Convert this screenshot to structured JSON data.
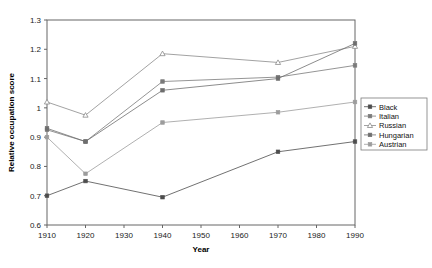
{
  "chart_data": {
    "type": "line",
    "title": "",
    "subtitle": "",
    "xlabel": "Year",
    "ylabel": "Relative occupation score",
    "x": [
      1910,
      1920,
      1940,
      1970,
      1990
    ],
    "xticklabels": [
      "1910",
      "1920",
      "1930",
      "1940",
      "1950",
      "1960",
      "1970",
      "1980",
      "1990"
    ],
    "xticks": [
      1910,
      1920,
      1930,
      1940,
      1950,
      1960,
      1970,
      1980,
      1990
    ],
    "yticklabels": [
      "0.6",
      "0.7",
      "0.8",
      "0.9",
      "1",
      "1.1",
      "1.2",
      "1.3"
    ],
    "yticks": [
      0.6,
      0.7,
      0.8,
      0.9,
      1.0,
      1.1,
      1.2,
      1.3
    ],
    "xlim": [
      1910,
      1990
    ],
    "ylim": [
      0.6,
      1.3
    ],
    "grid": false,
    "legend_position": "right",
    "series": [
      {
        "name": "Black",
        "marker": "filled-square",
        "color": "#4d4d4d",
        "values": [
          0.7,
          0.75,
          0.695,
          0.85,
          0.885
        ]
      },
      {
        "name": "Italian",
        "marker": "filled-square",
        "color": "#7a7a7a",
        "values": [
          0.925,
          0.885,
          1.09,
          1.105,
          1.145
        ]
      },
      {
        "name": "Russian",
        "marker": "open-triangle",
        "color": "#8a8a8a",
        "values": [
          1.02,
          0.975,
          1.185,
          1.155,
          1.21
        ]
      },
      {
        "name": "Hungarian",
        "marker": "filled-square",
        "color": "#6e6e6e",
        "values": [
          0.93,
          0.885,
          1.06,
          1.1,
          1.22
        ]
      },
      {
        "name": "Austrian",
        "marker": "filled-square",
        "color": "#9c9c9c",
        "values": [
          0.9,
          0.775,
          0.95,
          0.985,
          1.02
        ]
      }
    ]
  },
  "legend": {
    "entries": [
      {
        "label": "Black"
      },
      {
        "label": "Italian"
      },
      {
        "label": "Russian"
      },
      {
        "label": "Hungarian"
      },
      {
        "label": "Austrian"
      }
    ]
  }
}
